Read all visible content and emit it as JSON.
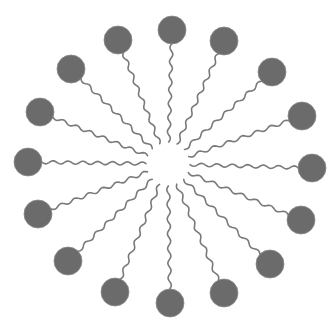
{
  "diagram": {
    "type": "micelle",
    "center": [
      168,
      164
    ],
    "inner_radius": 22,
    "head_radius": 14,
    "colors": {
      "head": "#6b6b6b",
      "tail": "#7a7a7a",
      "background": "#ffffff"
    },
    "molecules": [
      {
        "head": [
          172,
          30
        ]
      },
      {
        "head": [
          224,
          41
        ]
      },
      {
        "head": [
          272,
          72
        ]
      },
      {
        "head": [
          302,
          116
        ]
      },
      {
        "head": [
          312,
          168
        ]
      },
      {
        "head": [
          301,
          220
        ]
      },
      {
        "head": [
          270,
          264
        ]
      },
      {
        "head": [
          224,
          293
        ]
      },
      {
        "head": [
          170,
          303
        ]
      },
      {
        "head": [
          115,
          292
        ]
      },
      {
        "head": [
          68,
          261
        ]
      },
      {
        "head": [
          38,
          214
        ]
      },
      {
        "head": [
          28,
          162
        ]
      },
      {
        "head": [
          40,
          112
        ]
      },
      {
        "head": [
          71,
          69
        ]
      },
      {
        "head": [
          118,
          40
        ]
      }
    ]
  }
}
